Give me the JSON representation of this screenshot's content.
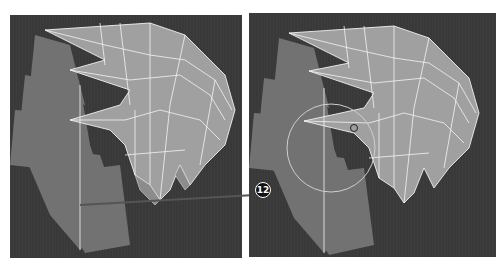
{
  "figure": {
    "panels": [
      {
        "id": "before",
        "label": "Hair mesh wireframe, before edit"
      },
      {
        "id": "after",
        "label": "Hair mesh wireframe with soft-selection brush circle"
      }
    ],
    "callout": {
      "number": "12"
    },
    "colors": {
      "background": "#ffffff",
      "viewport": "#3a3a3a",
      "mesh_fill": "#9a9a9a",
      "mesh_back": "#7a7a7a",
      "wireframe": "#f2f2f2",
      "badge_bg": "#111111",
      "badge_text": "#ffffff"
    }
  }
}
